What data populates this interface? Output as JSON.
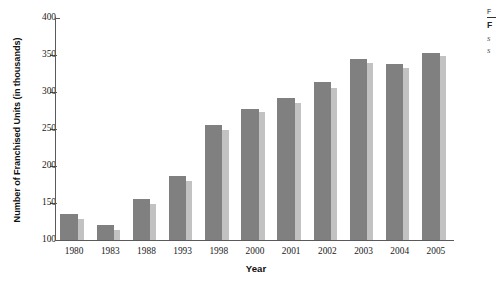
{
  "chart_data": {
    "type": "bar",
    "title": "",
    "xlabel": "Year",
    "ylabel": "Number of Franchised Units (in thousands)",
    "categories": [
      "1980",
      "1983",
      "1988",
      "1993",
      "1998",
      "2000",
      "2001",
      "2002",
      "2003",
      "2004",
      "2005"
    ],
    "yticks": [
      100,
      150,
      200,
      250,
      300,
      350,
      400
    ],
    "ylim": [
      100,
      400
    ],
    "grid": false,
    "legend_position": "none",
    "series": [
      {
        "name": "series-1",
        "color": "#808080",
        "values": [
          135,
          120,
          155,
          186,
          255,
          277,
          292,
          313,
          344,
          338,
          353
        ]
      },
      {
        "name": "series-2",
        "color": "#c2c2c2",
        "values": [
          129,
          114,
          149,
          180,
          248,
          273,
          285,
          306,
          339,
          333,
          348
        ]
      }
    ]
  },
  "side_caption": {
    "line1": "F",
    "heading": "F",
    "note1": "S",
    "note2": "S"
  }
}
